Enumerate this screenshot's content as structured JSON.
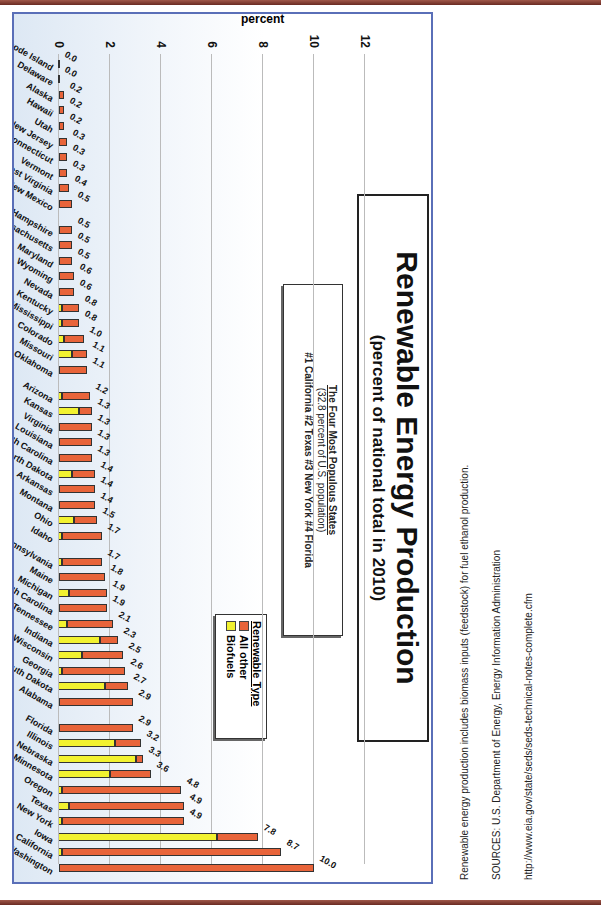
{
  "chart_data": {
    "type": "bar",
    "stacked": true,
    "title": "Renewable Energy Production",
    "subtitle": "(percent of national total in 2010)",
    "ylabel": "percent",
    "xlabel": "",
    "ylim": [
      0,
      12
    ],
    "yticks": [
      0,
      2,
      4,
      6,
      8,
      10,
      12
    ],
    "grid": true,
    "legend": {
      "title": "Renewable Type",
      "entries": [
        "All other",
        "Biofuels"
      ],
      "colors": [
        "#e8643a",
        "#f2f230"
      ]
    },
    "categories": [
      "Washington",
      "California",
      "Iowa",
      "New York",
      "Texas",
      "Oregon",
      "Minnesota",
      "Nebraska",
      "Illinois",
      "Florida",
      "Alabama",
      "South Dakota",
      "Georgia",
      "Wisconsin",
      "Indiana",
      "Tennessee",
      "North Carolina",
      "Michigan",
      "Maine",
      "Pennsylvania",
      "Idaho",
      "Ohio",
      "Montana",
      "Arkansas",
      "North Dakota",
      "South Carolina",
      "Louisiana",
      "Virginia",
      "Kansas",
      "Arizona",
      "Oklahoma",
      "Missouri",
      "Colorado",
      "Mississippi",
      "Kentucky",
      "Nevada",
      "Wyoming",
      "Maryland",
      "Massachusetts",
      "New Hampshire",
      "New Mexico",
      "West Virginia",
      "Vermont",
      "Connecticut",
      "New Jersey",
      "Utah",
      "Hawaii",
      "Alaska",
      "Delaware",
      "Rhode Island"
    ],
    "totals": [
      10.0,
      8.7,
      7.8,
      4.9,
      4.9,
      4.8,
      3.6,
      3.3,
      3.2,
      2.9,
      2.9,
      2.7,
      2.6,
      2.5,
      2.3,
      2.1,
      1.9,
      1.9,
      1.8,
      1.7,
      1.7,
      1.5,
      1.4,
      1.4,
      1.4,
      1.3,
      1.3,
      1.3,
      1.3,
      1.2,
      1.1,
      1.1,
      1.0,
      0.8,
      0.8,
      0.6,
      0.6,
      0.5,
      0.5,
      0.5,
      0.5,
      0.4,
      0.3,
      0.3,
      0.3,
      0.2,
      0.2,
      0.2,
      0.0,
      0.0
    ],
    "series": [
      {
        "name": "Biofuels",
        "values": [
          0.0,
          0.1,
          6.2,
          0.1,
          0.4,
          0.1,
          2.0,
          3.0,
          2.2,
          0.0,
          0.0,
          1.8,
          0.1,
          0.9,
          1.6,
          0.3,
          0.0,
          0.4,
          0.0,
          0.1,
          0.1,
          0.6,
          0.0,
          0.0,
          0.5,
          0.0,
          0.0,
          0.0,
          0.8,
          0.1,
          0.0,
          0.5,
          0.2,
          0.1,
          0.1,
          0.0,
          0.0,
          0.0,
          0.0,
          0.0,
          0.0,
          0.0,
          0.0,
          0.0,
          0.0,
          0.0,
          0.0,
          0.0,
          0.0,
          0.0
        ]
      },
      {
        "name": "All other",
        "values": [
          10.0,
          8.6,
          1.6,
          4.8,
          4.5,
          4.7,
          1.6,
          0.3,
          1.0,
          2.9,
          2.9,
          0.9,
          2.5,
          1.6,
          0.7,
          1.8,
          1.9,
          1.5,
          1.8,
          1.6,
          1.6,
          0.9,
          1.4,
          1.4,
          0.9,
          1.3,
          1.3,
          1.3,
          0.5,
          1.1,
          1.1,
          0.6,
          0.8,
          0.7,
          0.7,
          0.6,
          0.6,
          0.5,
          0.5,
          0.5,
          0.5,
          0.4,
          0.3,
          0.3,
          0.3,
          0.2,
          0.2,
          0.2,
          0.0,
          0.0
        ]
      }
    ],
    "value_labels": [
      "10.0",
      "8.7",
      "7.8",
      "4.9",
      "4.9",
      "4.8",
      "3.6",
      "3.3",
      "3.2",
      "2.9",
      "2.9",
      "2.7",
      "2.6",
      "2.5",
      "2.3",
      "2.1",
      "1.9",
      "1.9",
      "1.8",
      "1.7",
      "1.7",
      "1.5",
      "1.4",
      "1.4",
      "1.4",
      "1.3",
      "1.3",
      "1.3",
      "1.3",
      "1.2",
      "1.1",
      "1.1",
      "1.0",
      "0.8",
      "0.8",
      "0.6",
      "0.6",
      "0.5",
      "0.5",
      "0.5",
      "0.5",
      "0.4",
      "0.3",
      "0.3",
      "0.3",
      "0.2",
      "0.2",
      "0.2",
      "0.0",
      "0.0"
    ],
    "highlighted_states": [
      "California",
      "Texas",
      "New York",
      "Florida"
    ],
    "annotation": {
      "title": "The Four Most Populous States",
      "subtitle": "(32.8 percent of U.S. population)",
      "ranking": "#1 California  #2 Texas  #3 New York  #4 Florida"
    }
  },
  "header": {
    "title": "Renewable Energy Production",
    "subtitle": "(percent of national total in 2010)"
  },
  "annotation_box": {
    "title": "The Four Most Populous States",
    "subtitle": "(32.8 percent of U.S. population)",
    "ranking": "#1 California  #2 Texas  #3 New York  #4 Florida"
  },
  "legend": {
    "title": "Renewable Type",
    "items": [
      {
        "label": "All other",
        "color": "#e8643a"
      },
      {
        "label": "Biofuels",
        "color": "#f2f230"
      }
    ]
  },
  "axis": {
    "ylabel": "percent",
    "ticks": [
      "0",
      "2",
      "4",
      "6",
      "8",
      "10",
      "12"
    ]
  },
  "notes": {
    "line1": "Renewable energy production includes biomass inputs (feedstock) for fuel ethanol production.",
    "line2": "SOURCES: U.S. Department of Energy, Energy Information Administration",
    "line3": "http://www.eia.gov/state/seds/seds-technical-notes-complete.cfm"
  }
}
